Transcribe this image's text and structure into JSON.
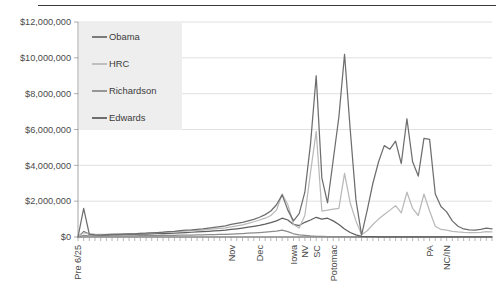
{
  "chart_data": {
    "type": "line",
    "title": "",
    "subtitle": "",
    "xlabel": "",
    "ylabel": "",
    "ylim": [
      0,
      12000000
    ],
    "ytick_values": [
      0,
      2000000,
      4000000,
      6000000,
      8000000,
      10000000,
      12000000
    ],
    "ytick_labels": [
      "$0",
      "$2,000,000",
      "$4,000,000",
      "$6,000,000",
      "$8,000,000",
      "$10,000,000",
      "$12,000,000"
    ],
    "grid": true,
    "grid_axis": "y",
    "legend_position": "top-left",
    "x_labeled_ticks": [
      {
        "index": 0,
        "label": "Pre 6/25"
      },
      {
        "index": 27,
        "label": "Nov"
      },
      {
        "index": 32,
        "label": "Dec"
      },
      {
        "index": 38,
        "label": "Iowa"
      },
      {
        "index": 40,
        "label": "NV"
      },
      {
        "index": 42,
        "label": "SC"
      },
      {
        "index": 45,
        "label": "Potomac"
      },
      {
        "index": 62,
        "label": "PA"
      },
      {
        "index": 65,
        "label": "NC/IN"
      }
    ],
    "x_tick_count": 74,
    "series": [
      {
        "name": "Obama",
        "color": "#6e6e6e",
        "values": [
          0,
          1600000,
          150000,
          120000,
          110000,
          130000,
          150000,
          140000,
          160000,
          180000,
          170000,
          200000,
          210000,
          230000,
          250000,
          270000,
          300000,
          320000,
          350000,
          380000,
          400000,
          430000,
          460000,
          500000,
          540000,
          580000,
          620000,
          700000,
          760000,
          820000,
          900000,
          980000,
          1100000,
          1250000,
          1450000,
          1800000,
          2350000,
          1500000,
          900000,
          1300000,
          2500000,
          5200000,
          9000000,
          3300000,
          1900000,
          4300000,
          6700000,
          10200000,
          6000000,
          2100000,
          100000,
          1500000,
          3000000,
          4200000,
          5100000,
          4900000,
          5350000,
          4100000,
          6600000,
          4200000,
          3400000,
          5500000,
          5450000,
          2400000,
          1700000,
          1400000,
          900000,
          600000,
          450000,
          400000,
          380000,
          420000,
          500000,
          450000
        ]
      },
      {
        "name": "HRC",
        "color": "#b9b9b9",
        "values": [
          0,
          250000,
          180000,
          150000,
          140000,
          150000,
          160000,
          170000,
          175000,
          185000,
          190000,
          200000,
          215000,
          230000,
          245000,
          260000,
          275000,
          290000,
          310000,
          330000,
          350000,
          370000,
          390000,
          420000,
          450000,
          480000,
          510000,
          560000,
          620000,
          680000,
          760000,
          850000,
          950000,
          1050000,
          1200000,
          1500000,
          2400000,
          1800000,
          700000,
          500000,
          1200000,
          3600000,
          5900000,
          1450000,
          1500000,
          1550000,
          1600000,
          3550000,
          1900000,
          900000,
          120000,
          350000,
          700000,
          1000000,
          1250000,
          1500000,
          1750000,
          1350000,
          2500000,
          1600000,
          1200000,
          2400000,
          1450000,
          600000,
          420000,
          380000,
          320000,
          280000,
          260000,
          250000,
          240000,
          260000,
          300000,
          280000
        ]
      },
      {
        "name": "Richardson",
        "color": "#8c8c8c",
        "values": [
          0,
          90000,
          70000,
          60000,
          58000,
          60000,
          62000,
          64000,
          66000,
          68000,
          70000,
          72000,
          74000,
          78000,
          82000,
          86000,
          90000,
          95000,
          100000,
          105000,
          110000,
          115000,
          120000,
          128000,
          135000,
          142000,
          150000,
          165000,
          180000,
          195000,
          210000,
          230000,
          250000,
          275000,
          300000,
          330000,
          380000,
          300000,
          180000,
          120000,
          90000,
          60000,
          40000,
          30000,
          25000,
          20000,
          18000,
          16000,
          14000,
          12000,
          10000,
          10000,
          10000,
          10000,
          10000,
          10000,
          10000,
          10000,
          10000,
          10000,
          10000,
          10000,
          10000,
          10000,
          10000,
          10000,
          10000,
          10000,
          10000,
          10000,
          10000,
          10000,
          10000,
          10000
        ]
      },
      {
        "name": "Edwards",
        "color": "#5f5f5f",
        "values": [
          0,
          300000,
          160000,
          130000,
          120000,
          125000,
          130000,
          135000,
          140000,
          145000,
          150000,
          158000,
          165000,
          175000,
          185000,
          195000,
          205000,
          220000,
          235000,
          250000,
          265000,
          280000,
          300000,
          320000,
          340000,
          360000,
          385000,
          420000,
          460000,
          500000,
          545000,
          595000,
          650000,
          720000,
          800000,
          900000,
          1050000,
          950000,
          700000,
          640000,
          820000,
          950000,
          1100000,
          1000000,
          1050000,
          900000,
          700000,
          450000,
          250000,
          120000,
          40000,
          20000,
          15000,
          12000,
          10000,
          10000,
          10000,
          10000,
          10000,
          10000,
          10000,
          10000,
          10000,
          10000,
          10000,
          10000,
          10000,
          10000,
          10000,
          10000,
          10000,
          10000,
          10000,
          10000
        ]
      }
    ],
    "legend_entries": [
      {
        "label": "Obama",
        "color": "#6e6e6e"
      },
      {
        "label": "HRC",
        "color": "#b9b9b9"
      },
      {
        "label": "Richardson",
        "color": "#8c8c8c"
      },
      {
        "label": "Edwards",
        "color": "#5f5f5f"
      }
    ]
  },
  "colors": {
    "axis": "#9a9a9a",
    "grid": "#d8d8d8",
    "text": "#4a4a4a",
    "legend_bg": "#eeeeee",
    "top_rule": "#3a3a3a"
  }
}
